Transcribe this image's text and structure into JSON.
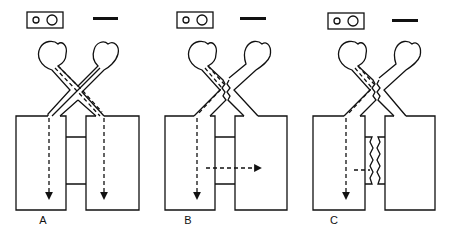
{
  "figure": {
    "panels": [
      {
        "id": "A",
        "label": "A",
        "description": "Crossing channels, both flows proceed straight down; chambers joined by open bridge"
      },
      {
        "id": "B",
        "label": "B",
        "description": "Wavy (sealed) crossing; one flow down left chamber, lateral flow through bridge to right chamber"
      },
      {
        "id": "C",
        "label": "C",
        "description": "Wavy crossing; bridge sealed with wavy membranes, lateral flow blocked"
      }
    ],
    "legend_items": [
      "two-circle slide icon",
      "scale bar"
    ],
    "colors": {
      "stroke": "#111111",
      "background": "#ffffff"
    }
  }
}
